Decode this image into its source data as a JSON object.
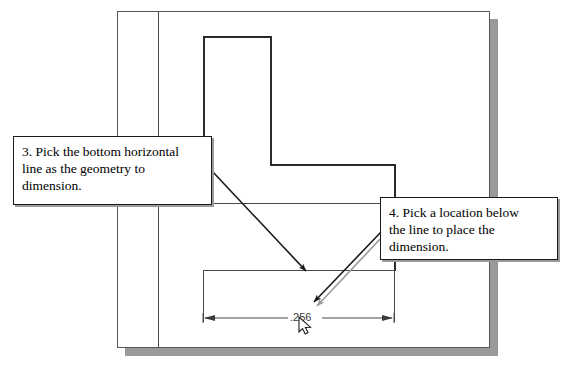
{
  "app": {
    "type": "cad-tutorial-figure",
    "canvas_background": "#ffffff",
    "shadow_color": "#9a9a9a",
    "line_color": "#4a4a4a",
    "heavy_line_color": "#2b2b2b"
  },
  "drawing": {
    "dimension": {
      "value": ".256",
      "name": "horizontal-dimension"
    },
    "cursor": {
      "name": "mouse-pointer",
      "x": 303,
      "y": 322
    }
  },
  "callouts": [
    {
      "id": "callout-3",
      "lines": [
        "3. Pick the bottom horizontal",
        "line as the geometry to",
        "dimension."
      ],
      "full_text": "3. Pick the bottom horizontal line as the geometry to dimension."
    },
    {
      "id": "callout-4",
      "lines": [
        "4. Pick a location below",
        "the line to place the",
        "dimension."
      ],
      "full_text": "4. Pick a location below the line to place the dimension."
    }
  ]
}
